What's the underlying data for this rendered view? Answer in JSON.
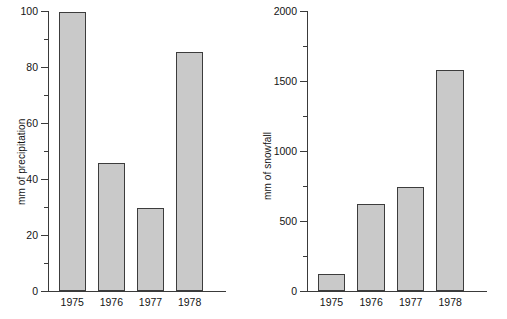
{
  "figure": {
    "title": "",
    "background": "#ffffff",
    "bar_fill": "#c9c9c9",
    "bar_edge": "#3c3c3c",
    "axis_color": "#3a3a3a"
  },
  "chart_data": [
    {
      "type": "bar",
      "title": "",
      "xlabel": "",
      "ylabel": "mm of precipitation",
      "categories": [
        "1975",
        "1976",
        "1977",
        "1978"
      ],
      "values": [
        99.5,
        45.8,
        29.5,
        85.5
      ],
      "ylim": [
        0,
        100
      ],
      "ymajor_ticks": [
        0,
        20,
        40,
        60,
        80,
        100
      ],
      "ymajor_tick_labels": [
        "0",
        "20",
        "40",
        "60",
        "80",
        "100"
      ],
      "yminor_ticks": [
        10,
        30,
        50,
        70,
        90
      ],
      "grid": false,
      "legend": false,
      "legend_position": "none"
    },
    {
      "type": "bar",
      "title": "",
      "xlabel": "",
      "ylabel": "mm of snowfall",
      "categories": [
        "1975",
        "1976",
        "1977",
        "1978"
      ],
      "values": [
        120,
        620,
        740,
        1580
      ],
      "ylim": [
        0,
        2000
      ],
      "ymajor_ticks": [
        0,
        500,
        1000,
        1500,
        2000
      ],
      "ymajor_tick_labels": [
        "0",
        "500",
        "1000",
        "1500",
        "2000"
      ],
      "yminor_ticks": [
        250,
        750,
        1250,
        1750
      ],
      "grid": false,
      "legend": false,
      "legend_position": "none"
    }
  ]
}
